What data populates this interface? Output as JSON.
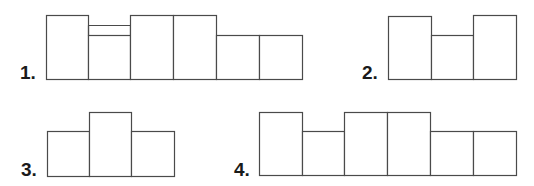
{
  "stroke_color": "#4a4a4a",
  "label_color": "#1a1a1a",
  "figures": [
    {
      "label": "1.",
      "label_pos": [
        20,
        63
      ],
      "bottom": 79,
      "columns": [
        {
          "x": 46,
          "w": 42,
          "top": 15
        },
        {
          "x": 88,
          "w": 42,
          "top": 35,
          "extra_line": 25
        },
        {
          "x": 130,
          "w": 43,
          "top": 15
        },
        {
          "x": 173,
          "w": 43,
          "top": 15
        },
        {
          "x": 216,
          "w": 43,
          "top": 35
        },
        {
          "x": 259,
          "w": 43,
          "top": 35
        }
      ]
    },
    {
      "label": "2.",
      "label_pos": [
        362,
        63
      ],
      "bottom": 79,
      "columns": [
        {
          "x": 388,
          "w": 43,
          "top": 16
        },
        {
          "x": 431,
          "w": 42,
          "top": 35
        },
        {
          "x": 473,
          "w": 43,
          "top": 15
        }
      ]
    },
    {
      "label": "3.",
      "label_pos": [
        21,
        160
      ],
      "bottom": 176,
      "columns": [
        {
          "x": 47,
          "w": 42,
          "top": 131
        },
        {
          "x": 89,
          "w": 42,
          "top": 112
        },
        {
          "x": 131,
          "w": 43,
          "top": 131
        }
      ]
    },
    {
      "label": "4.",
      "label_pos": [
        234,
        160
      ],
      "bottom": 175,
      "columns": [
        {
          "x": 259,
          "w": 43,
          "top": 112
        },
        {
          "x": 302,
          "w": 42,
          "top": 131
        },
        {
          "x": 344,
          "w": 43,
          "top": 112
        },
        {
          "x": 387,
          "w": 43,
          "top": 112
        },
        {
          "x": 430,
          "w": 43,
          "top": 131
        },
        {
          "x": 473,
          "w": 43,
          "top": 131
        }
      ]
    }
  ]
}
